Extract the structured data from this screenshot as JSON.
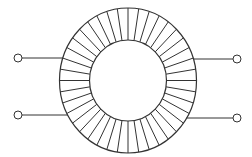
{
  "diagram": {
    "title": "",
    "type": "toroidal-transformer",
    "stroke_color": "#333333",
    "background": "#ffffff",
    "core": {
      "cx": 128,
      "cy": 80.5,
      "outer_rx": 68.5,
      "outer_ry": 72.5,
      "inner_rx": 38.5,
      "inner_ry": 40.5
    },
    "winding_count": 40,
    "terminals": [
      {
        "id": "left-top",
        "x": 18,
        "y": 58
      },
      {
        "id": "left-bottom",
        "x": 18,
        "y": 115
      },
      {
        "id": "right-top",
        "x": 237,
        "y": 59
      },
      {
        "id": "right-bottom",
        "x": 237,
        "y": 118
      }
    ]
  }
}
